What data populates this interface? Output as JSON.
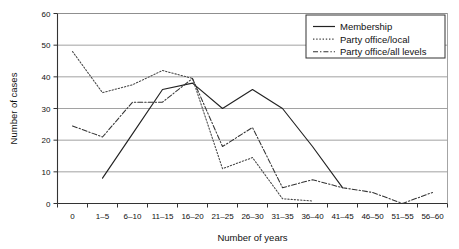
{
  "chart_data": {
    "type": "line",
    "title": "",
    "xlabel": "Number of years",
    "ylabel": "Number of cases",
    "categories": [
      "0",
      "1–5",
      "6–10",
      "11–15",
      "16–20",
      "21–25",
      "26–30",
      "31–35",
      "36–40",
      "41–45",
      "46–50",
      "51–55",
      "56–60"
    ],
    "xtick_labels": [
      "0",
      "1–5",
      "6–10",
      "11–15",
      "16–20",
      "21–25",
      "26–30",
      "31–35",
      "36–40",
      "41–45",
      "46–50",
      "51–55",
      "56–60"
    ],
    "ytick_labels": [
      "0",
      "10",
      "20",
      "30",
      "40",
      "50",
      "60"
    ],
    "ylim": [
      0,
      60
    ],
    "ytick_step": 10,
    "grid": "horizontal",
    "legend_position": "top-right",
    "series": [
      {
        "name": "Membership",
        "style": "solid",
        "color": "#222222",
        "values": [
          null,
          8,
          22,
          36,
          38,
          30,
          36,
          30,
          18,
          5,
          null,
          null,
          null
        ]
      },
      {
        "name": "Party office/local",
        "style": "dotted",
        "color": "#444444",
        "values": [
          48,
          35,
          37.5,
          42,
          39.5,
          11,
          14.5,
          1.5,
          0.8,
          null,
          null,
          null,
          null
        ]
      },
      {
        "name": "Party office/all levels",
        "style": "dashdot",
        "color": "#333333",
        "values": [
          24.5,
          21,
          32,
          32,
          39.5,
          18,
          24,
          5,
          7.5,
          5,
          3.5,
          0,
          3.5
        ]
      }
    ]
  },
  "legend": {
    "items": [
      {
        "label": "Membership"
      },
      {
        "label": "Party office/local"
      },
      {
        "label": "Party office/all levels"
      }
    ]
  },
  "axes": {
    "x_title": "Number of years",
    "y_title": "Number of cases"
  }
}
